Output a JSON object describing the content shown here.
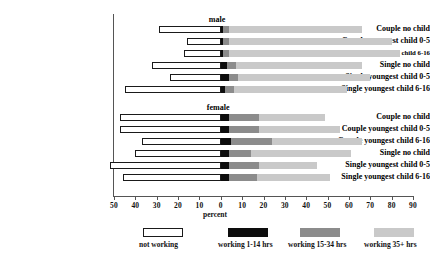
{
  "chart_data": {
    "type": "bar",
    "subtype": "diverging-stacked-horizontal",
    "title": "",
    "xlabel": "percent",
    "ylabel": "",
    "xlim": [
      -50,
      90
    ],
    "grid": false,
    "legend_position": "bottom",
    "axis_ticks": [
      {
        "label": "50",
        "value": -50
      },
      {
        "label": "40",
        "value": -40
      },
      {
        "label": "30",
        "value": -30
      },
      {
        "label": "20",
        "value": -20
      },
      {
        "label": "10",
        "value": -10
      },
      {
        "label": "0",
        "value": 0
      },
      {
        "label": "10",
        "value": 10
      },
      {
        "label": "20",
        "value": 20
      },
      {
        "label": "30",
        "value": 30
      },
      {
        "label": "40",
        "value": 40
      },
      {
        "label": "50",
        "value": 50
      },
      {
        "label": "60",
        "value": 60
      },
      {
        "label": "70",
        "value": 70
      },
      {
        "label": "80",
        "value": 80
      },
      {
        "label": "90",
        "value": 90
      }
    ],
    "legend": [
      {
        "name": "not working",
        "color": "#ffffff"
      },
      {
        "name": "working 1-14 hrs",
        "color": "#0d0d0d"
      },
      {
        "name": "working 15-34 hrs",
        "color": "#8c8c8c"
      },
      {
        "name": "working 35+ hrs",
        "color": "#c9c9c9"
      }
    ],
    "groups": [
      {
        "name": "male",
        "categories": [
          "Couple no child",
          "Couple youngest child 0-5",
          "Couple youngest child 6-16",
          "Single no child",
          "Single youngest child 0-5",
          "Single youngest child 6-16"
        ],
        "series": [
          {
            "name": "not working",
            "values": [
              29,
              16,
              17,
              32,
              24,
              45
            ]
          },
          {
            "name": "working 1-14 hrs",
            "values": [
              1,
              1,
              1,
              3,
              4,
              2
            ]
          },
          {
            "name": "working 15-34 hrs",
            "values": [
              3,
              3,
              3,
              4,
              4,
              4
            ]
          },
          {
            "name": "working 35+ hrs",
            "values": [
              62,
              76,
              80,
              59,
              62,
              53
            ]
          }
        ]
      },
      {
        "name": "female",
        "categories": [
          "Couple no child",
          "Couple youngest child 0-5",
          "Couple youngest child 6-16",
          "Single no child",
          "Single youngest child 0-5",
          "Single youngest child 6-16"
        ],
        "series": [
          {
            "name": "not working",
            "values": [
              47,
              47,
              37,
              40,
              52,
              46
            ]
          },
          {
            "name": "working 1-14 hrs",
            "values": [
              4,
              4,
              5,
              4,
              4,
              4
            ]
          },
          {
            "name": "working 15-34 hrs",
            "values": [
              14,
              14,
              19,
              10,
              14,
              13
            ]
          },
          {
            "name": "working 35+ hrs",
            "values": [
              31,
              38,
              42,
              47,
              27,
              34
            ]
          }
        ]
      }
    ]
  }
}
